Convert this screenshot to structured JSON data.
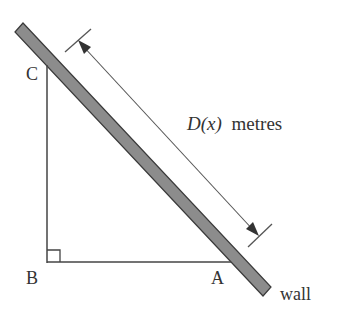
{
  "diagram": {
    "labels": {
      "C": "C",
      "B": "B",
      "A": "A",
      "wall": "wall",
      "distance_func": "D(x)",
      "distance_unit": "metres"
    },
    "colors": {
      "wall_fill": "#8c8c8c",
      "wall_edge": "#3a3a3a",
      "line": "#444444",
      "text": "#333333"
    },
    "elements": {
      "wall": "slanted wall from top-left to bottom-right",
      "triangle": "right triangle ABC with right angle at B",
      "dimension": "double-headed arrow parallel to wall measuring D(x)"
    }
  }
}
